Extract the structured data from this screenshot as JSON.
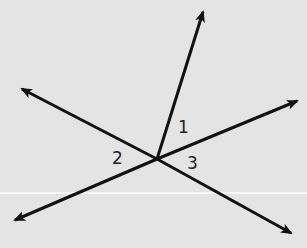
{
  "diagram": {
    "type": "lines-through-point",
    "background": "#e4e4e4",
    "stroke_color": "#111111",
    "intersection": {
      "x": 157,
      "y": 159
    },
    "rays": [
      {
        "name": "ray-top",
        "end": {
          "x": 203,
          "y": 12
        }
      },
      {
        "name": "ray-upper-left",
        "end": {
          "x": 22,
          "y": 89
        }
      },
      {
        "name": "ray-upper-right",
        "end": {
          "x": 297,
          "y": 101
        }
      },
      {
        "name": "ray-lower-left",
        "end": {
          "x": 15,
          "y": 220
        }
      },
      {
        "name": "ray-lower-right",
        "end": {
          "x": 291,
          "y": 233
        }
      }
    ],
    "angle_labels": [
      {
        "id": "1",
        "text": "1",
        "x": 178,
        "y": 133
      },
      {
        "id": "2",
        "text": "2",
        "x": 112,
        "y": 164
      },
      {
        "id": "3",
        "text": "3",
        "x": 187,
        "y": 169
      }
    ]
  }
}
